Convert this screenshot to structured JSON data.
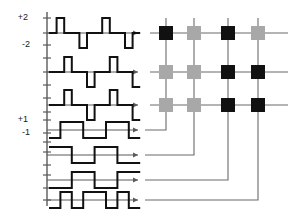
{
  "figure": {
    "background_color": "#ffffff",
    "width": 293,
    "height": 218
  },
  "colors": {
    "wave_stroke": "#111111",
    "axis_stroke": "#5a5a5a",
    "connector_stroke": "#6b6b6b",
    "cell_on": "#111111",
    "cell_off": "#a8a8a8",
    "label_text": "#1a1a1a"
  },
  "axis": {
    "labels": [
      {
        "id": "plus-two",
        "text": "+2",
        "x": 28,
        "y": 20
      },
      {
        "id": "minus-two",
        "text": "-2",
        "x": 30,
        "y": 47
      },
      {
        "id": "plus-one",
        "text": "+1",
        "x": 28,
        "y": 122
      },
      {
        "id": "minus-one",
        "text": "-1",
        "x": 30,
        "y": 135
      }
    ],
    "vertical_axis_x": 47,
    "vertical_axis_top": 12,
    "vertical_axis_bottom": 206,
    "tick_ys": [
      18,
      33,
      45,
      58,
      72,
      85,
      98,
      112,
      120,
      133,
      142,
      152,
      165,
      175,
      188,
      200
    ],
    "tick_half_width": 4
  },
  "chart_data": {
    "type": "line",
    "xlabel": "",
    "ylabel": "",
    "grid": false,
    "legend_position": "none",
    "waveform_count": 7,
    "ternary_levels": [
      2,
      0,
      -2
    ],
    "binary_levels": [
      1,
      -1
    ],
    "samples_per_trace": 12,
    "traces": [
      {
        "id": "output-1",
        "kind": "ternary",
        "row": 1,
        "baseline_y": 33,
        "amplitude_px": 15,
        "axis_start_x": 47,
        "axis_end_x": 138,
        "sample_width": 7.6,
        "values": [
          0,
          2,
          0,
          0,
          -2,
          0,
          0,
          2,
          0,
          0,
          -2,
          0
        ]
      },
      {
        "id": "output-2",
        "kind": "ternary",
        "row": 2,
        "baseline_y": 72,
        "amplitude_px": 15,
        "axis_start_x": 47,
        "axis_end_x": 138,
        "sample_width": 7.6,
        "values": [
          0,
          0,
          2,
          0,
          0,
          -2,
          0,
          0,
          2,
          0,
          0,
          -2
        ]
      },
      {
        "id": "output-3",
        "kind": "ternary",
        "row": 3,
        "baseline_y": 105,
        "amplitude_px": 15,
        "axis_start_x": 47,
        "axis_end_x": 138,
        "sample_width": 7.6,
        "values": [
          0,
          0,
          2,
          0,
          0,
          -2,
          0,
          0,
          2,
          0,
          0,
          -2
        ]
      },
      {
        "id": "input-1",
        "kind": "binary",
        "row": 4,
        "baseline_y": 130,
        "amplitude_px": 8,
        "axis_start_x": 47,
        "axis_end_x": 138,
        "sample_width": 11.4,
        "values": [
          -1,
          1,
          1,
          -1,
          -1,
          1,
          1,
          -1
        ]
      },
      {
        "id": "input-2",
        "kind": "binary",
        "row": 5,
        "baseline_y": 155,
        "amplitude_px": 8,
        "axis_start_x": 47,
        "axis_end_x": 138,
        "sample_width": 11.4,
        "values": [
          1,
          1,
          -1,
          -1,
          1,
          1,
          -1,
          -1
        ]
      },
      {
        "id": "input-3",
        "kind": "binary",
        "row": 6,
        "baseline_y": 180,
        "amplitude_px": 8,
        "axis_start_x": 47,
        "axis_end_x": 138,
        "sample_width": 11.4,
        "values": [
          -1,
          -1,
          1,
          1,
          -1,
          -1,
          1,
          1
        ]
      },
      {
        "id": "input-4",
        "kind": "binary",
        "row": 7,
        "baseline_y": 200,
        "amplitude_px": 8,
        "axis_start_x": 47,
        "axis_end_x": 138,
        "sample_width": 11.4,
        "values": [
          -1,
          1,
          -1,
          1,
          1,
          -1,
          1,
          -1
        ]
      }
    ]
  },
  "matrix": {
    "id": "weight-matrix",
    "rows": 3,
    "cols": 4,
    "cell_size": 14,
    "col_xs": [
      166,
      194,
      228,
      258
    ],
    "row_ys": [
      33,
      72,
      105
    ],
    "row_line_start_x": 150,
    "row_line_end_x": 288,
    "col_line_top_y": 18,
    "col_line_bottom_y": 118,
    "states": [
      [
        "on",
        "off",
        "on",
        "off"
      ],
      [
        "off",
        "off",
        "on",
        "on"
      ],
      [
        "off",
        "off",
        "on",
        "on"
      ]
    ],
    "state_values": {
      "on": 1,
      "off": 0
    },
    "legend": {
      "on_label": "active weight",
      "off_label": "inactive weight"
    }
  },
  "connectors": [
    {
      "id": "connector-input-1",
      "from_trace": "input-1",
      "to_col": 0,
      "start_x": 145,
      "start_y": 130,
      "turn_x": 166,
      "end_y": 118
    },
    {
      "id": "connector-input-2",
      "from_trace": "input-2",
      "to_col": 1,
      "start_x": 145,
      "start_y": 155,
      "turn_x": 194,
      "end_y": 118
    },
    {
      "id": "connector-input-3",
      "from_trace": "input-3",
      "to_col": 2,
      "start_x": 145,
      "start_y": 180,
      "turn_x": 228,
      "end_y": 118
    },
    {
      "id": "connector-input-4",
      "from_trace": "input-4",
      "to_col": 3,
      "start_x": 145,
      "start_y": 200,
      "turn_x": 258,
      "end_y": 118
    }
  ]
}
